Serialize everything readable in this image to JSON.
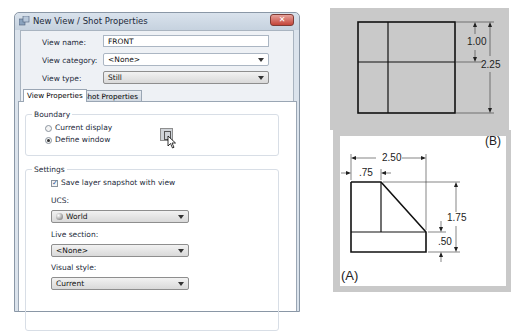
{
  "dialog": {
    "title": "New View / Shot Properties",
    "close_label": "✕",
    "fields": {
      "view_name_label": "View name:",
      "view_name_value": "FRONT",
      "view_category_label": "View category:",
      "view_category_value": "<None>",
      "view_type_label": "View type:",
      "view_type_value": "Still"
    },
    "tabs": [
      {
        "label": "View Properties",
        "active": true
      },
      {
        "label": "Shot Properties",
        "active": false
      }
    ],
    "boundary": {
      "title": "Boundary",
      "options": [
        {
          "label": "Current display",
          "checked": false
        },
        {
          "label": "Define window",
          "checked": true
        }
      ],
      "define_window_button": "define-window-icon"
    },
    "settings": {
      "title": "Settings",
      "save_layer_snapshot_label": "Save layer snapshot with view",
      "save_layer_snapshot_checked": true,
      "ucs_label": "UCS:",
      "ucs_value": "World",
      "live_section_label": "Live section:",
      "live_section_value": "<None>",
      "visual_style_label": "Visual style:",
      "visual_style_value": "Current"
    }
  },
  "drawings": {
    "B": {
      "label": "(B)",
      "dims": {
        "top_section": "1.00",
        "total_height": "2.25"
      }
    },
    "A": {
      "label": "(A)",
      "dims": {
        "width": "2.50",
        "left_offset": ".75",
        "height": "1.75",
        "base": ".50"
      }
    }
  }
}
